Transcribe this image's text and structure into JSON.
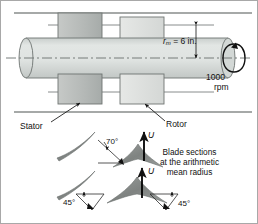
{
  "figure": {
    "type": "axial-turbomachine-stage-diagram",
    "background": "#ffffff",
    "border_color": "#9a9a9a",
    "colors": {
      "shaft_fill": "#d8dcda",
      "shaft_stroke": "#6e7472",
      "stator_block_fill": "#b9bcba",
      "rotor_block_fill": "#dcdedc",
      "block_stroke": "#6f7472",
      "casing_line": "#5a5f5d",
      "centerline": "#6a6f6d",
      "blade_gray": "#8b8f8d",
      "arrow_black": "#000000",
      "leader_line": "#2b2b2b"
    }
  },
  "labels": {
    "mean_radius": {
      "symbol": "r",
      "subscript": "m",
      "value": " = 6 in."
    },
    "rotation_speed": {
      "value": "1000",
      "unit": "rpm"
    },
    "stator": "Stator",
    "rotor": "Rotor",
    "angle_stator_exit": "70°",
    "angle_rotor_inlet": "45°",
    "angle_rotor_exit": "45°",
    "blade_speed_upper": "U",
    "blade_speed_lower": "U",
    "caption": {
      "line1": "Blade sections",
      "line2": "at the arithmetic",
      "line3": "mean radius"
    }
  },
  "icons": {
    "rotation_arrow": "rotation-ellipse-arrow-icon",
    "velocity_arrow": "up-arrow-icon",
    "dimension_arrow": "dimension-arrow-icon"
  }
}
